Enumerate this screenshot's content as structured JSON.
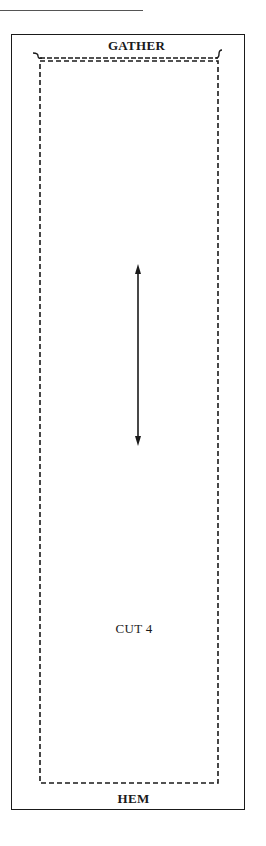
{
  "pattern": {
    "top_edge_label": "GATHER",
    "bottom_edge_label": "HEM",
    "cut_instruction": "CUT 4",
    "grainline": {
      "orientation": "vertical",
      "double_headed": true
    },
    "icons": {
      "grainline_arrow": "double-headed-arrow-icon",
      "gather_marks": "gather-curl-icon"
    },
    "colors": {
      "line": "#1a1a1a",
      "background": "#ffffff",
      "rule": "#555555"
    }
  }
}
